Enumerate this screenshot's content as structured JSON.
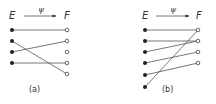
{
  "panels": [
    {
      "id": "a",
      "caption": "(a)",
      "domain_label": "E",
      "codomain_label": "F",
      "map_label": "ψ",
      "domain_points": 4,
      "codomain_points": 5,
      "mapping": [
        [
          1,
          1
        ],
        [
          2,
          5
        ],
        [
          3,
          2
        ],
        [
          4,
          4
        ]
      ]
    },
    {
      "id": "b",
      "caption": "(b)",
      "domain_label": "E",
      "codomain_label": "F",
      "map_label": "ψ",
      "domain_points": 6,
      "codomain_points": 4,
      "mapping": [
        [
          1,
          1
        ],
        [
          2,
          2
        ],
        [
          3,
          2
        ],
        [
          4,
          3
        ],
        [
          5,
          4
        ],
        [
          6,
          1
        ]
      ]
    }
  ],
  "colors": {
    "line": "#555555",
    "filled_dot": "#222222",
    "text": "#333333"
  }
}
